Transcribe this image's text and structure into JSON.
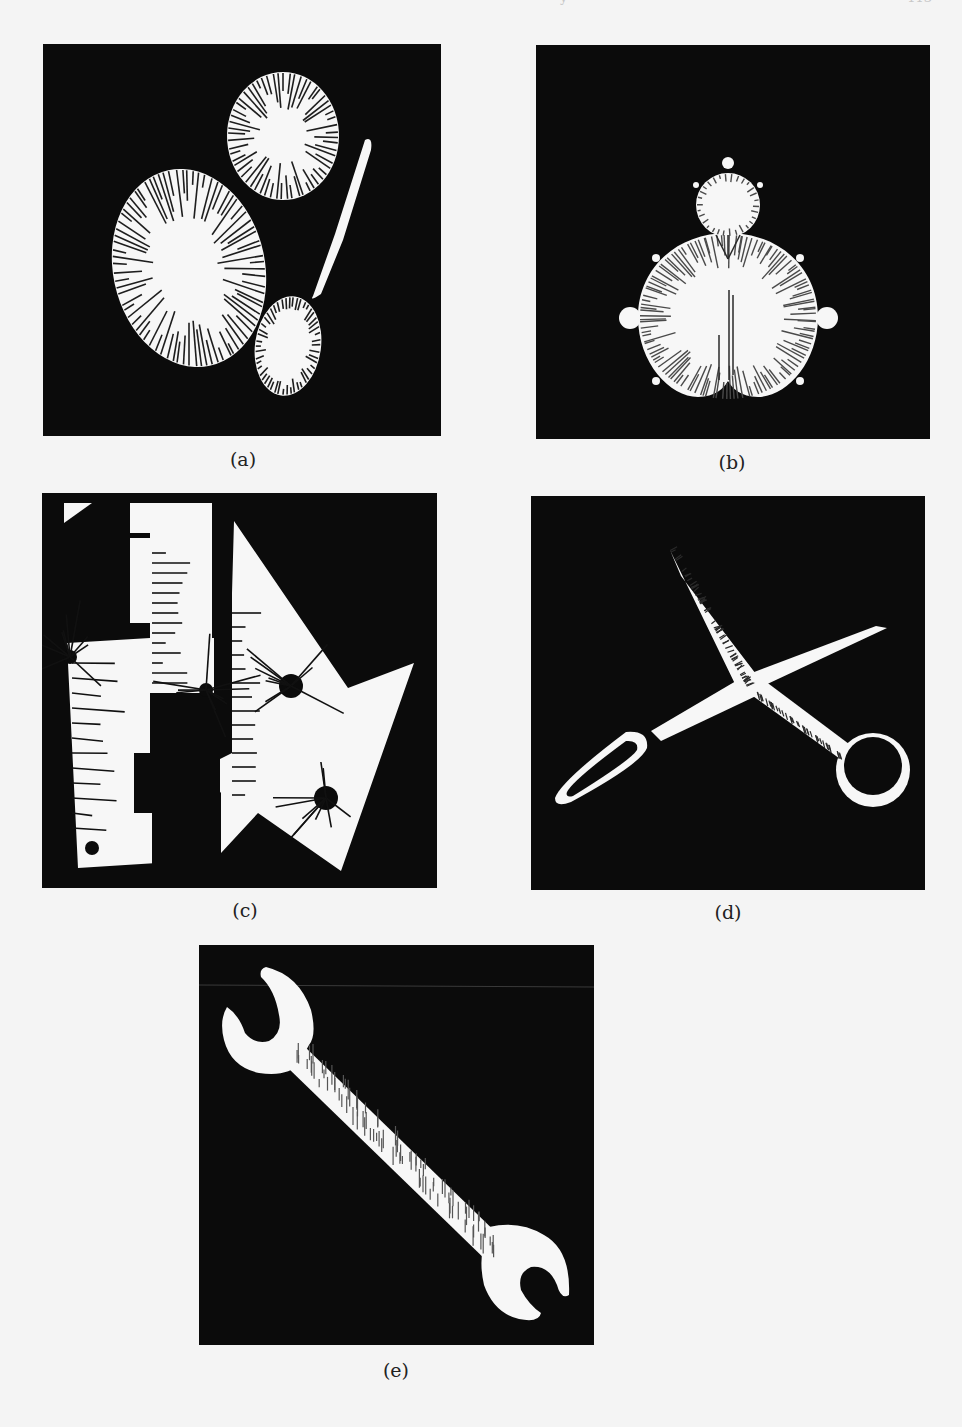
{
  "page": {
    "header_fragments": [
      "y",
      "113"
    ]
  },
  "figure": {
    "panels": [
      {
        "id": "a",
        "caption": "(a)",
        "subject": "two ellipses and a spoon with skeleton/medial-axis ticks",
        "colors": {
          "background": "#0b0b0b",
          "shape": "#f7f7f7",
          "ticks": "#1e1e1e"
        }
      },
      {
        "id": "b",
        "caption": "(b)",
        "subject": "Mandelbrot set silhouette with radial ticks",
        "colors": {
          "background": "#0b0b0b",
          "shape": "#f7f7f7",
          "ticks": "#4a4a4a"
        }
      },
      {
        "id": "c",
        "caption": "(c)",
        "subject": "polygonal shapes with holes and radial line segments",
        "colors": {
          "background": "#0b0b0b",
          "shape": "#f7f7f7",
          "ticks": "#111111"
        }
      },
      {
        "id": "d",
        "caption": "(d)",
        "subject": "scissors silhouette with edge ticks",
        "colors": {
          "background": "#0b0b0b",
          "shape": "#f7f7f7",
          "ticks": "#2a2a2a"
        }
      },
      {
        "id": "e",
        "caption": "(e)",
        "subject": "open-end wrench silhouette with cross ticks",
        "colors": {
          "background": "#0b0b0b",
          "shape": "#f7f7f7",
          "ticks": "#555555"
        }
      }
    ]
  }
}
